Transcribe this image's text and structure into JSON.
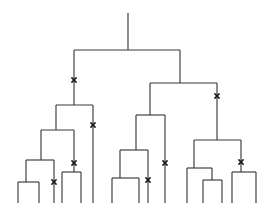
{
  "figure": {
    "type": "cladogram",
    "width": 272,
    "height": 203,
    "background_color": "#ffffff",
    "line_color": "#3a3a3a",
    "mark_color": "#1a1a1a",
    "line_width": 1.15,
    "mark_glyph": "x",
    "mark_size": 4.2
  },
  "tree_data": {
    "root_stem": {
      "x": 128,
      "y_top": 13,
      "y_bottom": 50
    },
    "horizontal_bars": [
      {
        "name": "root-split",
        "y": 50,
        "x1": 74,
        "x2": 180
      },
      {
        "name": "left-clade-split",
        "y": 105,
        "x1": 56,
        "x2": 93
      },
      {
        "name": "left-inner-split",
        "y": 130,
        "x1": 41,
        "x2": 74
      },
      {
        "name": "left-lower-split",
        "y": 160,
        "x1": 26,
        "x2": 54
      },
      {
        "name": "left-leafpair-split",
        "y": 182,
        "x1": 18,
        "x2": 39
      },
      {
        "name": "left-right-pair-split",
        "y": 172,
        "x1": 62,
        "x2": 81
      },
      {
        "name": "right-clade-split",
        "y": 83,
        "x1": 150,
        "x2": 217
      },
      {
        "name": "mid-clade-split",
        "y": 115,
        "x1": 136,
        "x2": 165
      },
      {
        "name": "mid-inner-split",
        "y": 150,
        "x1": 120,
        "x2": 148
      },
      {
        "name": "mid-leafpair-split",
        "y": 178,
        "x1": 112,
        "x2": 139
      },
      {
        "name": "right-lower-split",
        "y": 140,
        "x1": 194,
        "x2": 241
      },
      {
        "name": "right-left-group-split",
        "y": 168,
        "x1": 187,
        "x2": 212
      },
      {
        "name": "right-leafpair-split",
        "y": 180,
        "x1": 203,
        "x2": 222
      },
      {
        "name": "right-far-split",
        "y": 172,
        "x1": 232,
        "x2": 256
      }
    ],
    "vertical_lines": [
      {
        "name": "root-left-arm",
        "x": 74,
        "y1": 50,
        "y2": 105
      },
      {
        "name": "root-right-arm",
        "x": 180,
        "y1": 50,
        "y2": 83
      },
      {
        "name": "left-clade-left-arm",
        "x": 56,
        "y1": 105,
        "y2": 130
      },
      {
        "name": "left-clade-right-arm",
        "x": 93,
        "y1": 105,
        "y2": 203
      },
      {
        "name": "left-inner-left-arm",
        "x": 41,
        "y1": 130,
        "y2": 160
      },
      {
        "name": "left-inner-right-arm",
        "x": 74,
        "y1": 130,
        "y2": 172
      },
      {
        "name": "left-lower-left-arm",
        "x": 26,
        "y1": 160,
        "y2": 182
      },
      {
        "name": "left-lower-right-arm",
        "x": 54,
        "y1": 160,
        "y2": 203
      },
      {
        "name": "left-leaf-1",
        "x": 18,
        "y1": 182,
        "y2": 203
      },
      {
        "name": "left-leaf-2",
        "x": 39,
        "y1": 182,
        "y2": 203
      },
      {
        "name": "left-pair-leaf-1",
        "x": 62,
        "y1": 172,
        "y2": 203
      },
      {
        "name": "left-pair-leaf-2",
        "x": 81,
        "y1": 172,
        "y2": 203
      },
      {
        "name": "right-clade-left-arm",
        "x": 150,
        "y1": 83,
        "y2": 115
      },
      {
        "name": "right-clade-right-arm",
        "x": 217,
        "y1": 83,
        "y2": 140
      },
      {
        "name": "mid-clade-left-arm",
        "x": 136,
        "y1": 115,
        "y2": 150
      },
      {
        "name": "mid-clade-right-arm",
        "x": 165,
        "y1": 115,
        "y2": 203
      },
      {
        "name": "mid-inner-left-arm",
        "x": 120,
        "y1": 150,
        "y2": 178
      },
      {
        "name": "mid-inner-right-arm",
        "x": 148,
        "y1": 150,
        "y2": 203
      },
      {
        "name": "mid-leaf-1",
        "x": 112,
        "y1": 178,
        "y2": 203
      },
      {
        "name": "mid-leaf-2",
        "x": 139,
        "y1": 178,
        "y2": 203
      },
      {
        "name": "right-lower-left-arm",
        "x": 194,
        "y1": 140,
        "y2": 168
      },
      {
        "name": "right-lower-right-arm",
        "x": 241,
        "y1": 140,
        "y2": 172
      },
      {
        "name": "right-group-leaf-1",
        "x": 187,
        "y1": 168,
        "y2": 203
      },
      {
        "name": "right-group-right-arm",
        "x": 212,
        "y1": 168,
        "y2": 180
      },
      {
        "name": "right-pair-leaf-1",
        "x": 203,
        "y1": 180,
        "y2": 203
      },
      {
        "name": "right-pair-leaf-2",
        "x": 222,
        "y1": 180,
        "y2": 203
      },
      {
        "name": "right-far-leaf-1",
        "x": 232,
        "y1": 172,
        "y2": 203
      },
      {
        "name": "right-far-leaf-2",
        "x": 256,
        "y1": 172,
        "y2": 203
      }
    ],
    "mutation_marks": [
      {
        "name": "mark-root-left-arm",
        "x": 74,
        "y": 80
      },
      {
        "name": "mark-left-clade-right-arm",
        "x": 93,
        "y": 125
      },
      {
        "name": "mark-left-inner-right-arm",
        "x": 74,
        "y": 163
      },
      {
        "name": "mark-left-lower-right-arm",
        "x": 54,
        "y": 182
      },
      {
        "name": "mark-mid-clade-right-arm",
        "x": 165,
        "y": 163
      },
      {
        "name": "mark-mid-inner-right-arm",
        "x": 148,
        "y": 180
      },
      {
        "name": "mark-right-clade-right-arm",
        "x": 217,
        "y": 96
      },
      {
        "name": "mark-right-lower-right-arm",
        "x": 241,
        "y": 162
      }
    ],
    "leaf_tip_positions": [
      18,
      39,
      54,
      62,
      81,
      93,
      112,
      139,
      148,
      165,
      187,
      203,
      222,
      232,
      256
    ],
    "counts": {
      "leaves": 15,
      "internal_splits": 14,
      "mutation_marks": 8
    }
  }
}
